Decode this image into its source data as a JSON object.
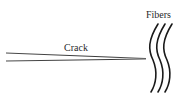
{
  "diagram": {
    "labels": {
      "crack": "Crack",
      "fibers": "Fibers"
    },
    "colors": {
      "stroke": "#1a1a1a",
      "text": "#2a2a2a",
      "background": "#ffffff"
    },
    "fiber_count": 3
  }
}
